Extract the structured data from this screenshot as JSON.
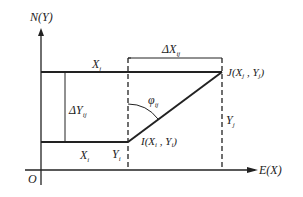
{
  "diagram": {
    "axis_y_label": "N(Y)",
    "axis_x_label": "E(X)",
    "origin_label": "O",
    "top_segment_label": "X",
    "top_segment_sub": "j",
    "bottom_segment_label": "X",
    "bottom_segment_sub": "i",
    "delta_x_label": "ΔX",
    "delta_x_sub": "ij",
    "delta_y_label": "ΔY",
    "delta_y_sub": "ij",
    "angle_label": "φ",
    "angle_sub": "ij",
    "point_j_label": "J(X",
    "point_j_sub1": "j",
    "point_j_mid": " , Y",
    "point_j_sub2": "j",
    "point_j_end": ")",
    "point_i_label": "I(X",
    "point_i_sub1": "i",
    "point_i_mid": " , Y",
    "point_i_sub2": "i",
    "point_i_end": ")",
    "yi_label": "Y",
    "yi_sub": "i",
    "yj_label": "Y",
    "yj_sub": "j",
    "colors": {
      "line": "#222222",
      "background": "#ffffff"
    }
  }
}
